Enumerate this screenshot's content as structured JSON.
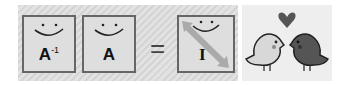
{
  "equation": {
    "left_matrix_label": "A",
    "left_matrix_superscript": "-1",
    "right_matrix_label": "A",
    "equals_sign": "=",
    "result_matrix_label": "I"
  },
  "illustration": {
    "description": "two birds with heart"
  },
  "colors": {
    "panel": "#d9d9d9",
    "border": "#666666",
    "light_bird": "#d8d8d8",
    "dark_bird": "#555555"
  }
}
